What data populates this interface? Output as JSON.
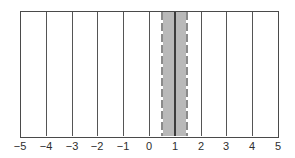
{
  "figure": {
    "type": "number-line",
    "axis": {
      "min": -5,
      "max": 5,
      "step": 1,
      "ticks": [
        "−5",
        "−4",
        "−3",
        "−2",
        "−1",
        "0",
        "1",
        "2",
        "3",
        "4",
        "5"
      ]
    },
    "shaded_interval": {
      "from": 0.5,
      "to": 1.5,
      "center": 1,
      "boundary_style": "dashed"
    },
    "colors": {
      "background": "#ffffff",
      "line": "#4a4a4a",
      "center_line": "#3c3c3c",
      "shade": "#b9b9b9",
      "dashed_boundary": "#8b8b8b",
      "label_text": "#2e2e2e"
    }
  }
}
